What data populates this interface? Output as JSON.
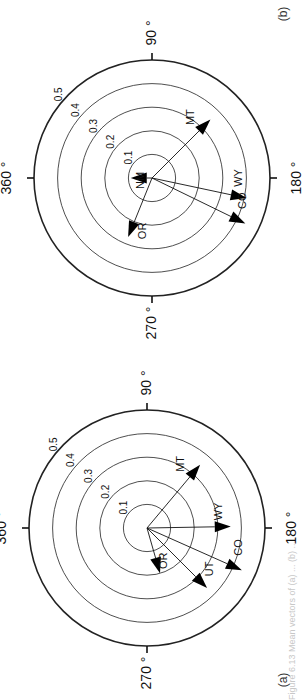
{
  "figure": {
    "caption": "Figure 6.13  Mean vectors of (a) ... (b) ...",
    "orientation": "rotated 90° counter-clockwise on page"
  },
  "chart_data": [
    {
      "type": "polar-vector",
      "panel_label": "(b)",
      "title": "",
      "angle_labels": [
        "360 °",
        "90 °",
        "180 °",
        "270 °"
      ],
      "angle_label_positions_deg": [
        0,
        90,
        180,
        270
      ],
      "radial_ticks": [
        0.1,
        0.2,
        0.3,
        0.4,
        0.5
      ],
      "radial_tick_labels": [
        "0.1",
        "0.2",
        "0.3",
        "0.4",
        "0.5"
      ],
      "rmax": 0.5,
      "direction": "clockwise from 360° (north)",
      "vectors": [
        {
          "label": "MT",
          "angle_deg": 135,
          "length": 0.35
        },
        {
          "label": "WY",
          "angle_deg": 192,
          "length": 0.41
        },
        {
          "label": "CO",
          "angle_deg": 206,
          "length": 0.44
        },
        {
          "label": "OR",
          "angle_deg": 292,
          "length": 0.27
        },
        {
          "label": "NM",
          "angle_deg": 0,
          "length": 0.09
        }
      ]
    },
    {
      "type": "polar-vector",
      "panel_label": "(a)",
      "title": "",
      "angle_labels": [
        "360 °",
        "90 °",
        "180 °",
        "270 °"
      ],
      "angle_label_positions_deg": [
        0,
        90,
        180,
        270
      ],
      "radial_ticks": [
        0.1,
        0.2,
        0.3,
        0.4,
        0.5
      ],
      "radial_tick_labels": [
        "0.1",
        "0.2",
        "0.3",
        "0.4",
        "0.5"
      ],
      "rmax": 0.5,
      "direction": "clockwise from 360° (north)",
      "vectors": [
        {
          "label": "MT",
          "angle_deg": 130,
          "length": 0.35
        },
        {
          "label": "WY",
          "angle_deg": 179,
          "length": 0.355
        },
        {
          "label": "CO",
          "angle_deg": 204,
          "length": 0.44
        },
        {
          "label": "UT",
          "angle_deg": 225,
          "length": 0.36
        },
        {
          "label": "OR",
          "angle_deg": 254,
          "length": 0.2
        }
      ]
    }
  ]
}
